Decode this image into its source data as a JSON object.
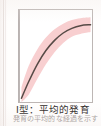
{
  "figure": {
    "caption_line1": "Ⅰ型：平均的発育",
    "caption_line2": "発育の平均的な経過を示す",
    "frame_color": "#bdb6b4",
    "background_color": "#ffffff"
  },
  "chart_data": {
    "type": "line",
    "title": "Ⅰ型：平均的発育",
    "xlabel": "",
    "ylabel": "",
    "xlim": [
      0,
      100
    ],
    "ylim": [
      0,
      100
    ],
    "grid": false,
    "legend": "none",
    "curve_color": "#564a46",
    "band_color": "#f8cfd0",
    "series": [
      {
        "name": "平均発育曲線",
        "x": [
          2,
          12,
          24,
          36,
          48,
          60,
          72,
          84,
          98
        ],
        "values": [
          4,
          22,
          41,
          56,
          67,
          75,
          80,
          83,
          84
        ]
      }
    ],
    "band": {
      "name": "変動範囲",
      "x": [
        2,
        12,
        24,
        36,
        48,
        60,
        72,
        84,
        98
      ],
      "upper": [
        16,
        39,
        57,
        70,
        79,
        85,
        89,
        91,
        92
      ],
      "lower": [
        0,
        8,
        25,
        41,
        54,
        64,
        71,
        74,
        76
      ]
    }
  }
}
